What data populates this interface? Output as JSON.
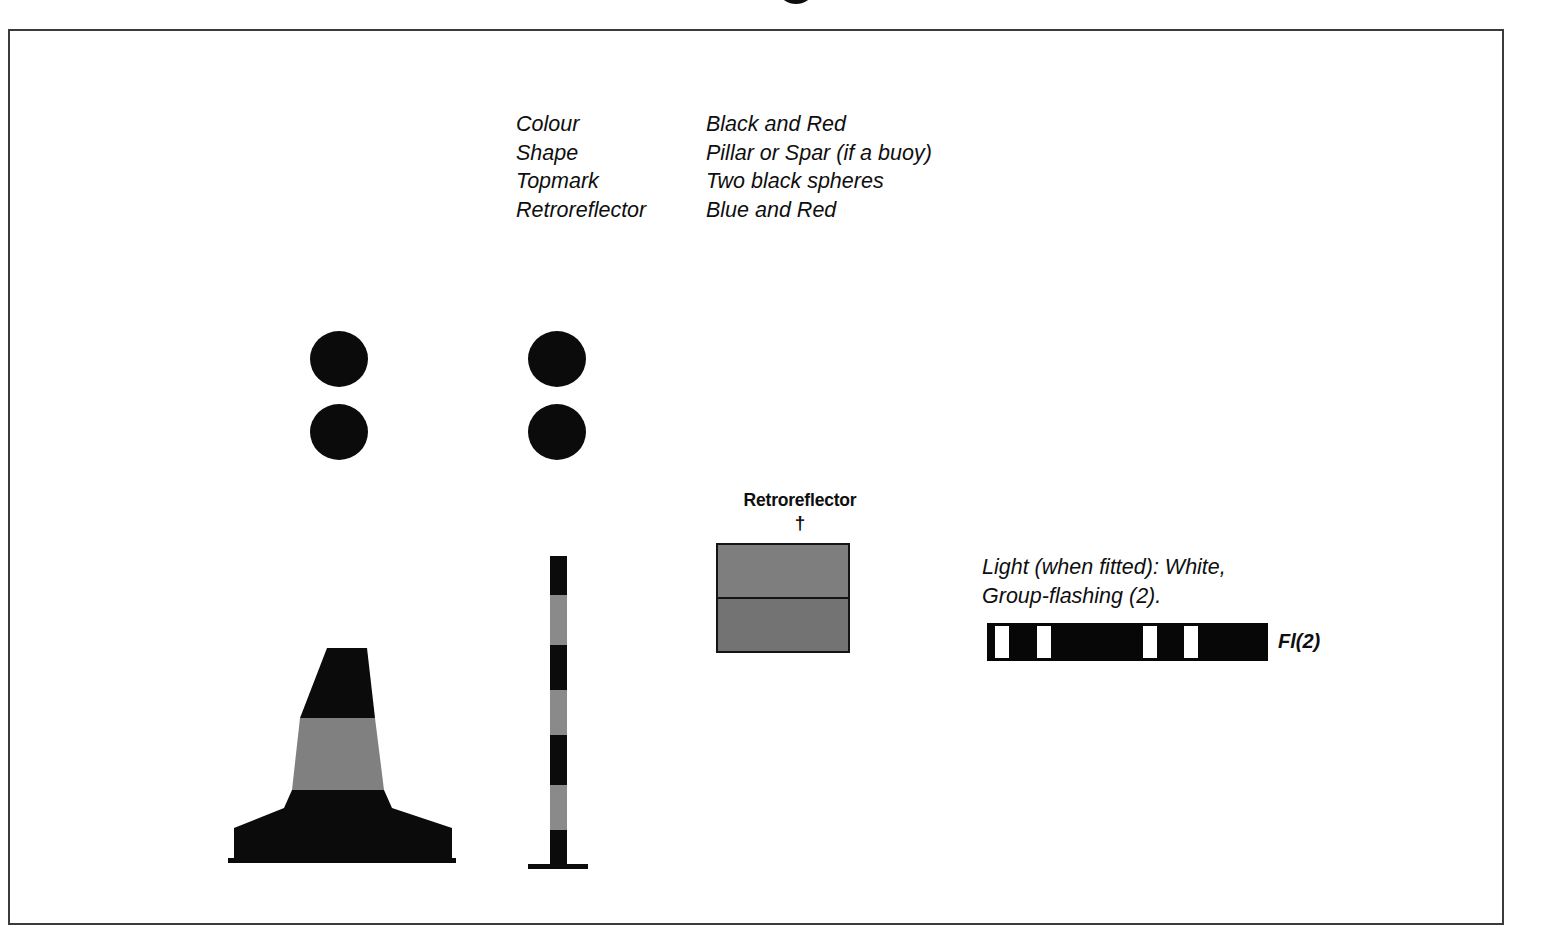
{
  "page": {
    "background_color": "#ffffff",
    "frame_border_color": "#3b3b3b",
    "title_fragment_visible": true
  },
  "spec_table": {
    "rows": [
      {
        "key": "Colour",
        "value": "Black and Red"
      },
      {
        "key": "Shape",
        "value": "Pillar or Spar (if a buoy)"
      },
      {
        "key": "Topmark",
        "value": "Two black spheres"
      },
      {
        "key": "Retroreflector",
        "value": "Blue and Red"
      }
    ]
  },
  "topmarks": [
    {
      "name": "topmark-pillar",
      "spheres": 2,
      "color": "#0b0b0b"
    },
    {
      "name": "topmark-spar",
      "spheres": 2,
      "color": "#0b0b0b"
    }
  ],
  "buoys": {
    "pillar": {
      "label": "Pillar buoy",
      "bands": [
        {
          "name": "black-upper",
          "color": "#0b0b0b"
        },
        {
          "name": "red-middle",
          "color": "#808080"
        },
        {
          "name": "black-lower",
          "color": "#0b0b0b"
        }
      ]
    },
    "spar": {
      "label": "Spar buoy",
      "bands": [
        {
          "name": "black",
          "color": "#0b0b0b"
        },
        {
          "name": "red",
          "color": "#8a8a8a"
        },
        {
          "name": "black",
          "color": "#0b0b0b"
        },
        {
          "name": "red",
          "color": "#8a8a8a"
        },
        {
          "name": "black",
          "color": "#0b0b0b"
        },
        {
          "name": "red",
          "color": "#8a8a8a"
        },
        {
          "name": "black",
          "color": "#0b0b0b"
        }
      ]
    }
  },
  "retroreflector": {
    "label": "Retroreflector",
    "dagger": "†",
    "bands": [
      {
        "name": "blue",
        "color": "#7e7e7e"
      },
      {
        "name": "red",
        "color": "#737373"
      }
    ]
  },
  "light": {
    "description": "Light (when fitted): White,\nGroup-flashing (2).",
    "abbreviation": "Fl(2)",
    "bar_color": "#070707",
    "flash_color": "#ffffff",
    "flashes": [
      {
        "left_pct": 3.0,
        "width_pct": 5.0
      },
      {
        "left_pct": 17.8,
        "width_pct": 5.0
      },
      {
        "left_pct": 55.5,
        "width_pct": 5.0
      },
      {
        "left_pct": 70.0,
        "width_pct": 5.0
      }
    ]
  }
}
